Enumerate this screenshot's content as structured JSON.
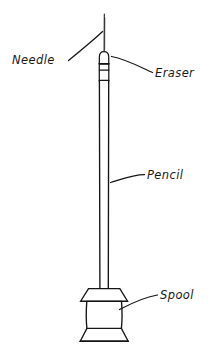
{
  "figure": {
    "background_color": "#ffffff",
    "ink_color": "#151515",
    "style": "hand-drawn line art with italic handwritten labels"
  },
  "labels": [
    {
      "id": "needle",
      "text": "Needle",
      "x": 12,
      "y": 62,
      "anchor": "start",
      "leader": "M 70,60 C 84,48 96,38 104,32",
      "points_to": "needle-shaft"
    },
    {
      "id": "eraser",
      "text": "Eraser",
      "x": 156,
      "y": 76,
      "anchor": "start",
      "leader": "M 112,57 C 128,60 142,68 152,72",
      "points_to": "eraser-ferrule"
    },
    {
      "id": "pencil",
      "text": "Pencil",
      "x": 147,
      "y": 180,
      "anchor": "start",
      "leader": "M 110,182 C 122,178 134,174 144,175",
      "points_to": "pencil-body"
    },
    {
      "id": "spool",
      "text": "Spool",
      "x": 160,
      "y": 300,
      "anchor": "start",
      "leader": "M 120,309 C 134,302 148,296 157,295",
      "points_to": "spool-body"
    }
  ],
  "parts": {
    "needle": {
      "name": "needle",
      "description": "thin straight pin inserted into the top of the eraser",
      "top_y": 14,
      "bottom_y": 52,
      "x": 104
    },
    "eraser_ferrule": {
      "name": "eraser-ferrule",
      "description": "rounded eraser cap with two metal ferrule bands",
      "top_y": 52,
      "bottom_y": 88,
      "band_y": [
        63,
        70,
        80
      ],
      "left_x": 99,
      "right_x": 109
    },
    "pencil_body": {
      "name": "pencil-body",
      "description": "long straight wooden shaft of the pencil",
      "top_y": 88,
      "bottom_y": 288,
      "left_x": 99.5,
      "right_x": 108.5
    },
    "spool": {
      "name": "spool",
      "description": "thread spool base with flared top and bottom flanges",
      "top_flange_y": 288,
      "bottom_flange_y": 341,
      "outer_left_x": 80,
      "outer_right_x": 128,
      "barrel_left_x": 88,
      "barrel_right_x": 120
    }
  }
}
